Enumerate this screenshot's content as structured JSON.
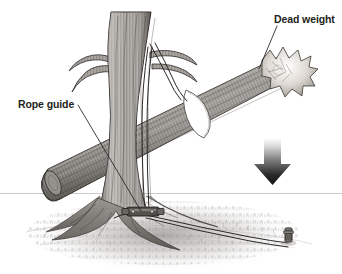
{
  "illustration": {
    "title": "Felling a leaning tree with a dead weight and rope guide",
    "style": "pen-and-ink technical illustration, grayscale",
    "background_color": "#ffffff",
    "ink_color": "#231f20",
    "width": 342,
    "height": 274
  },
  "labels": {
    "dead_weight": "Dead weight",
    "rope_guide": "Rope guide"
  },
  "annotations": [
    {
      "name": "dead-weight",
      "text": "Dead weight",
      "text_position": [
        274,
        14
      ],
      "leader_from": [
        277,
        26
      ],
      "leader_to": [
        259,
        69
      ],
      "points_at": "splintered broken end of the log resting on the tree"
    },
    {
      "name": "rope-guide",
      "text": "Rope guide",
      "text_position": [
        18,
        99
      ],
      "leader_from": [
        78,
        105
      ],
      "leader_to": [
        141,
        212
      ],
      "points_at": "metal rope guide clamp at the base of the tree trunk"
    }
  ],
  "elements": {
    "tree": {
      "name": "leaning-tree-trunk",
      "description": "Upright tree trunk with textured bark, a branch fork at upper left, a broken branch stub at upper right, and a flared root base"
    },
    "log": {
      "name": "dead-weight-log",
      "description": "Heavy log leaning diagonally from lower left to upper right, resting against the tree trunk; its upper right end is splintered and broken"
    },
    "rope_loop": {
      "name": "rope-loop-around-log",
      "description": "White rope loop wrapped around the middle of the log"
    },
    "ropes": {
      "name": "support-ropes",
      "description": "Ropes running from the branch stub down the trunk to the rope guide at the base, and from the guide out to a ground stake on the right"
    },
    "guide": {
      "name": "rope-guide-clamp",
      "description": "Metal rope guide device fastened at the base of the trunk"
    },
    "stake": {
      "name": "ground-stake",
      "description": "Short anchoring stake driven into the ground at lower right, tied off with rope"
    },
    "arrow": {
      "name": "downward-force-arrow",
      "description": "Large gradient arrow pointing straight down at the right side, indicating the direction of the dead weight force",
      "direction": "down",
      "position": [
        272,
        143
      ],
      "gradient_from": "#ffffff",
      "gradient_to": "#1a1a1a"
    },
    "horizon": {
      "name": "horizon-line",
      "description": "Thin light gray horizontal ground line spanning the full width",
      "y": 193,
      "color": "#c9c9c9"
    },
    "ground": {
      "name": "ground-grass",
      "description": "Stippled grass and soil texture surrounding the base of the tree"
    }
  }
}
